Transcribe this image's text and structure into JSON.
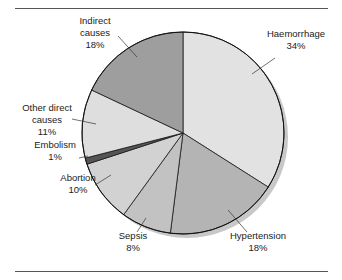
{
  "chart_data": {
    "type": "pie",
    "title": "",
    "start_angle_deg": 0,
    "direction": "clockwise",
    "legend": "none (direct labels with leader lines)",
    "slices": [
      {
        "label_lines": [
          "Haemorrhage",
          "34%"
        ],
        "name": "Haemorrhage",
        "value": 34,
        "color": "#e2e2e2",
        "label_pos": [
          296,
          34
        ],
        "leader": [
          [
            275,
            58
          ],
          [
            252,
            74
          ]
        ]
      },
      {
        "label_lines": [
          "Hypertension",
          "18%"
        ],
        "name": "Hypertension",
        "value": 18,
        "color": "#b4b4b4",
        "label_pos": [
          258,
          236
        ],
        "leader": [
          [
            247,
            232
          ],
          [
            228,
            210
          ]
        ]
      },
      {
        "label_lines": [
          "Sepsis",
          "8%"
        ],
        "name": "Sepsis",
        "value": 8,
        "color": "#c2c2c2",
        "label_pos": [
          133,
          236
        ],
        "leader": [
          [
            137,
            232
          ],
          [
            146,
            218
          ]
        ]
      },
      {
        "label_lines": [
          "Abortion",
          "10%"
        ],
        "name": "Abortion",
        "value": 10,
        "color": "#d2d2d2",
        "label_pos": [
          78,
          178
        ],
        "leader": [
          [
            95,
            185
          ],
          [
            111,
            175
          ]
        ]
      },
      {
        "label_lines": [
          "Embolism",
          "1%"
        ],
        "name": "Embolism",
        "value": 1,
        "color": "#555555",
        "label_pos": [
          55,
          145
        ],
        "leader": [
          [
            79,
            158
          ],
          [
            88,
            156
          ]
        ]
      },
      {
        "label_lines": [
          "Other direct",
          "causes",
          "11%"
        ],
        "name": "Other direct causes",
        "value": 11,
        "color": "#dedede",
        "label_pos": [
          47,
          108
        ],
        "leader": [
          [
            72,
            119
          ],
          [
            96,
            124
          ]
        ]
      },
      {
        "label_lines": [
          "Indirect",
          "causes",
          "18%"
        ],
        "name": "Indirect causes",
        "value": 18,
        "color": "#9e9e9e",
        "label_pos": [
          95,
          21
        ],
        "leader": [
          [
            118,
            36
          ],
          [
            137,
            57
          ]
        ]
      }
    ],
    "total": 100
  },
  "layout": {
    "center": [
      183,
      133
    ],
    "radius": 101,
    "shadow_offset": [
      4,
      4
    ],
    "shadow_color": "#c8c8c8",
    "top_rule_y": 8,
    "bottom_rule_y": 271
  }
}
